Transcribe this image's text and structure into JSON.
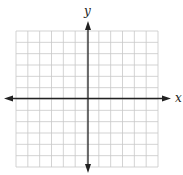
{
  "diagram": {
    "type": "coordinate-plane",
    "axes": {
      "x_label": "x",
      "y_label": "y"
    },
    "grid": {
      "columns": 12,
      "rows": 12,
      "cells_left_of_y_axis": 6,
      "cells_right_of_y_axis": 6,
      "cells_above_x_axis": 6,
      "cells_below_x_axis": 6,
      "show_tick_labels": false
    },
    "colors": {
      "grid_line": "#c8c8c8",
      "axis_line": "#222222",
      "background": "#ffffff"
    }
  }
}
